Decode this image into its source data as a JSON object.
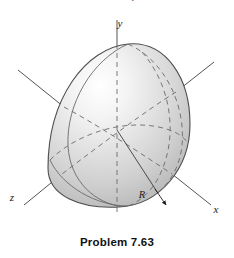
{
  "page": {
    "background_color": "#ffffff",
    "width": 234,
    "height": 258,
    "cropped_header_text": "determine the location of the semispherical volume"
  },
  "figure": {
    "caption": "Problem 7.63",
    "origin": {
      "x": 117,
      "y": 130
    },
    "axes": [
      {
        "name": "y",
        "label": "y",
        "label_x": 120,
        "label_y": 26,
        "style": "solid-above-dashed-inside",
        "from_x": 117,
        "from_y": 20,
        "to_x": 117,
        "to_y": 214
      },
      {
        "name": "x",
        "label": "x",
        "label_x": 215,
        "label_y": 212,
        "style": "solid",
        "from_x": 117,
        "from_y": 130,
        "to_x": 211,
        "to_y": 205
      },
      {
        "name": "z",
        "label": "z",
        "label_x": 10,
        "label_y": 200,
        "style": "solid",
        "from_x": 117,
        "from_y": 130,
        "to_x": 24,
        "to_y": 205
      }
    ],
    "radius": {
      "label": "R",
      "label_x": 143,
      "label_y": 196,
      "line_from_x": 117,
      "line_from_y": 130,
      "line_to_x": 165,
      "line_to_y": 205,
      "arrow": true
    },
    "body": {
      "shape": "tilted-hemisphere-solid",
      "outline_color": "#5a5a5a",
      "fill_light": "#fcfcfc",
      "fill_mid": "#dcdcdc",
      "fill_dark": "#a8a8a8",
      "highlight_x": 100,
      "highlight_y": 82
    },
    "colors": {
      "axis_line": "#555555",
      "dashed_line": "#666666",
      "outline": "#4e4e4e",
      "text": "#1a1a1a",
      "caption": "#111111"
    }
  }
}
